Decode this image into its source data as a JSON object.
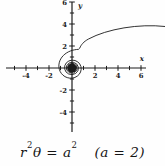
{
  "figure_title": "lituus spiral plot",
  "caption": {
    "r": "r",
    "r_exp": "2",
    "theta": "θ",
    "equals": " = ",
    "a": "a",
    "a_exp": "2",
    "condition": "(a = 2)"
  },
  "axes": {
    "x_letter": "x",
    "y_letter": "y"
  },
  "colors": {
    "ink": "#1b1b1b",
    "background": "#fefefe"
  },
  "chart_data": {
    "type": "line",
    "curve_name": "lituus spiral",
    "equation": "r^2 * theta = a^2",
    "a": 2,
    "xlabel": "x",
    "ylabel": "y",
    "xlim": [
      -5.7,
      6.4
    ],
    "ylim": [
      -6,
      5.9
    ],
    "grid": false,
    "x_ticks": [
      -4,
      -2,
      2,
      4,
      6
    ],
    "x_tick_labels": [
      "-4",
      "-2",
      "2",
      "4",
      "6"
    ],
    "y_ticks": [
      6,
      4,
      2,
      -2,
      -4
    ],
    "y_tick_labels": [
      "6",
      "4",
      "2",
      "-2",
      "-4"
    ],
    "minor_tick_step": 1,
    "polar_points": [
      {
        "theta": 0.1,
        "r": 6.32
      },
      {
        "theta": 0.25,
        "r": 4.0
      },
      {
        "theta": 0.5,
        "r": 2.83
      },
      {
        "theta": 1.0,
        "r": 2.0
      },
      {
        "theta": 1.57,
        "r": 1.6
      },
      {
        "theta": 3.14,
        "r": 1.13
      },
      {
        "theta": 6.28,
        "r": 0.8
      },
      {
        "theta": 12.57,
        "r": 0.56
      },
      {
        "theta": 25.13,
        "r": 0.4
      },
      {
        "theta": 50.27,
        "r": 0.28
      }
    ],
    "legend": null,
    "title": ""
  }
}
